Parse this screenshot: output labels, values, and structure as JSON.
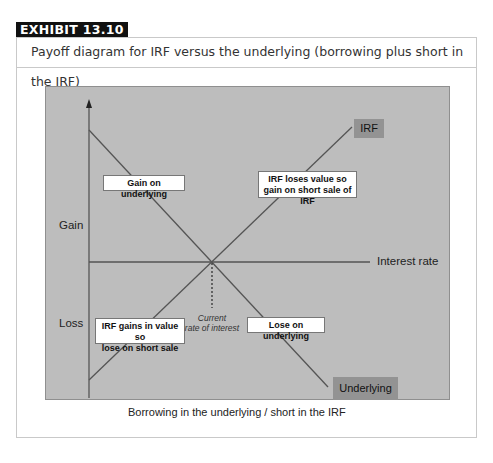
{
  "exhibit": {
    "tag": "EXHIBIT 13.10",
    "caption": "Payoff diagram for IRF versus the underlying (borrowing plus short in the IRF)"
  },
  "diagram": {
    "y_axis": {
      "gain_label": "Gain",
      "loss_label": "Loss"
    },
    "x_axis": {
      "label": "Interest rate"
    },
    "series": [
      {
        "name": "IRF",
        "direction": "rising",
        "label_color": "#939393"
      },
      {
        "name": "Underlying",
        "direction": "falling",
        "label_color": "#939393"
      }
    ],
    "callouts": {
      "gain_underlying": "Gain on underlying",
      "irf_loses_line1": "IRF loses value so",
      "irf_loses_line2": "gain on short sale of IRF",
      "irf_gains_line1": "IRF gains in value so",
      "irf_gains_line2": "lose on short sale",
      "lose_underlying": "Lose on underlying"
    },
    "annotation": {
      "line1": "Current",
      "line2": "rate of interest"
    },
    "footer": "Borrowing in the underlying / short in the IRF",
    "colors": {
      "panel": "#bdbdbd",
      "lines": "#555555",
      "tag_bg": "#111111"
    }
  }
}
